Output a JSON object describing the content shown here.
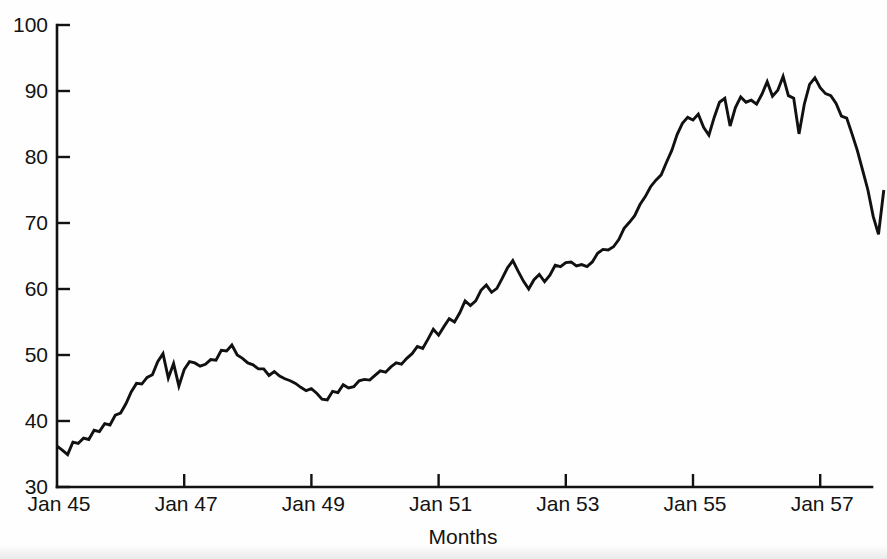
{
  "chart_data": {
    "type": "line",
    "title": "",
    "subtitle": "",
    "xlabel": "Months",
    "ylabel": "",
    "xlim": [
      "Jan 45",
      "Jan 58"
    ],
    "ylim": [
      30,
      100
    ],
    "yticks": [
      30,
      40,
      50,
      60,
      70,
      80,
      90,
      100
    ],
    "ytick_labels": [
      "30",
      "40",
      "50",
      "60",
      "70",
      "80",
      "90",
      "100"
    ],
    "xticks": [
      "Jan 45",
      "Jan 47",
      "Jan 49",
      "Jan 51",
      "Jan 53",
      "Jan 55",
      "Jan 57"
    ],
    "xtick_labels": [
      "Jan 45",
      "Jan 47",
      "Jan 49",
      "Jan 51",
      "Jan 53",
      "Jan 55",
      "Jan 57"
    ],
    "grid": false,
    "legend": false,
    "legend_position": "none",
    "axis_style": "open-left-bottom, ticks pointing inward",
    "line_color": "#111111",
    "background_color": "#ffffff",
    "x_start_label": "Jan 45",
    "x_months_per_tick": 24,
    "series": [
      {
        "name": "monthly value",
        "x": [
          "Jan 45",
          "Feb 45",
          "Mar 45",
          "Apr 45",
          "May 45",
          "Jun 45",
          "Jul 45",
          "Aug 45",
          "Sep 45",
          "Oct 45",
          "Nov 45",
          "Dec 45",
          "Jan 46",
          "Feb 46",
          "Mar 46",
          "Apr 46",
          "May 46",
          "Jun 46",
          "Jul 46",
          "Aug 46",
          "Sep 46",
          "Oct 46",
          "Nov 46",
          "Dec 46",
          "Jan 47",
          "Feb 47",
          "Mar 47",
          "Apr 47",
          "May 47",
          "Jun 47",
          "Jul 47",
          "Aug 47",
          "Sep 47",
          "Oct 47",
          "Nov 47",
          "Dec 47",
          "Jan 48",
          "Feb 48",
          "Mar 48",
          "Apr 48",
          "May 48",
          "Jun 48",
          "Jul 48",
          "Aug 48",
          "Sep 48",
          "Oct 48",
          "Nov 48",
          "Dec 48",
          "Jan 49",
          "Feb 49",
          "Mar 49",
          "Apr 49",
          "May 49",
          "Jun 49",
          "Jul 49",
          "Aug 49",
          "Sep 49",
          "Oct 49",
          "Nov 49",
          "Dec 49",
          "Jan 50",
          "Feb 50",
          "Mar 50",
          "Apr 50",
          "May 50",
          "Jun 50",
          "Jul 50",
          "Aug 50",
          "Sep 50",
          "Oct 50",
          "Nov 50",
          "Dec 50",
          "Jan 51",
          "Feb 51",
          "Mar 51",
          "Apr 51",
          "May 51",
          "Jun 51",
          "Jul 51",
          "Aug 51",
          "Sep 51",
          "Oct 51",
          "Nov 51",
          "Dec 51",
          "Jan 52",
          "Feb 52",
          "Mar 52",
          "Apr 52",
          "May 52",
          "Jun 52",
          "Jul 52",
          "Aug 52",
          "Sep 52",
          "Oct 52",
          "Nov 52",
          "Dec 52",
          "Jan 53",
          "Feb 53",
          "Mar 53",
          "Apr 53",
          "May 53",
          "Jun 53",
          "Jul 53",
          "Aug 53",
          "Sep 53",
          "Oct 53",
          "Nov 53",
          "Dec 53",
          "Jan 54",
          "Feb 54",
          "Mar 54",
          "Apr 54",
          "May 54",
          "Jun 54",
          "Jul 54",
          "Aug 54",
          "Sep 54",
          "Oct 54",
          "Nov 54",
          "Dec 54",
          "Jan 55",
          "Feb 55",
          "Mar 55",
          "Apr 55",
          "May 55",
          "Jun 55",
          "Jul 55",
          "Aug 55",
          "Sep 55",
          "Oct 55",
          "Nov 55",
          "Dec 55",
          "Jan 56",
          "Feb 56",
          "Mar 56",
          "Apr 56",
          "May 56",
          "Jun 56",
          "Jul 56",
          "Aug 56",
          "Sep 56",
          "Oct 56",
          "Nov 56",
          "Dec 56",
          "Jan 57",
          "Feb 57",
          "Mar 57",
          "Apr 57",
          "May 57",
          "Jun 57",
          "Jul 57",
          "Aug 57",
          "Sep 57",
          "Oct 57",
          "Nov 57",
          "Dec 57",
          "Jan 58"
        ],
        "values": [
          36.2,
          35.6,
          34.9,
          36.8,
          36.6,
          37.4,
          37.2,
          38.6,
          38.4,
          39.6,
          39.4,
          40.9,
          41.2,
          42.6,
          44.4,
          45.7,
          45.6,
          46.6,
          47.0,
          49.0,
          50.2,
          46.5,
          48.7,
          45.3,
          47.8,
          49.0,
          48.8,
          48.3,
          48.6,
          49.3,
          49.2,
          50.7,
          50.6,
          51.5,
          50.0,
          49.5,
          48.8,
          48.5,
          47.9,
          47.9,
          46.9,
          47.5,
          46.8,
          46.4,
          46.1,
          45.7,
          45.1,
          44.6,
          44.9,
          44.2,
          43.3,
          43.2,
          44.5,
          44.3,
          45.5,
          45.0,
          45.2,
          46.1,
          46.3,
          46.2,
          46.9,
          47.6,
          47.4,
          48.2,
          48.8,
          48.6,
          49.5,
          50.2,
          51.3,
          51.0,
          52.4,
          53.9,
          53.0,
          54.3,
          55.5,
          55.0,
          56.4,
          58.2,
          57.5,
          58.2,
          59.8,
          60.6,
          59.5,
          60.1,
          61.6,
          63.2,
          64.3,
          62.7,
          61.2,
          60.0,
          61.4,
          62.2,
          61.1,
          62.1,
          63.6,
          63.4,
          64.0,
          64.1,
          63.5,
          63.7,
          63.4,
          64.1,
          65.4,
          66.0,
          65.9,
          66.4,
          67.5,
          69.2,
          70.1,
          71.1,
          72.8,
          74.0,
          75.5,
          76.5,
          77.3,
          79.2,
          81.0,
          83.4,
          85.1,
          86.0,
          85.6,
          86.5,
          84.5,
          83.3,
          86.0,
          88.3,
          88.9,
          84.7,
          87.5,
          89.1,
          88.3,
          88.6,
          88.0,
          89.5,
          91.4,
          89.2,
          90.1,
          92.2,
          89.3,
          88.9,
          83.5,
          88.0,
          91.0,
          92.0,
          90.5,
          89.6,
          89.3,
          88.1,
          86.2,
          85.9,
          83.5,
          81.0,
          78.0,
          75.0,
          71.0,
          68.3,
          75.0
        ]
      }
    ]
  },
  "axes": {
    "y_axis_label": "",
    "x_axis_label": "Months",
    "y_min_label": "30",
    "y_max_label": "100"
  }
}
